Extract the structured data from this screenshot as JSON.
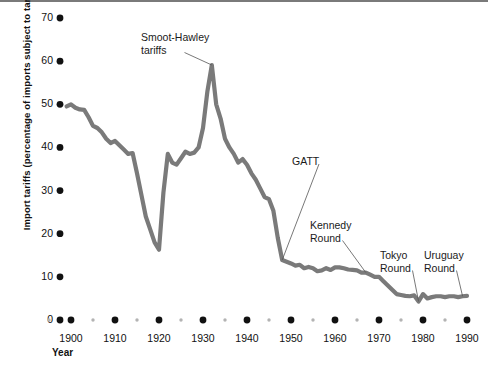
{
  "chart_data": {
    "type": "line",
    "title": "",
    "xlabel": "Year",
    "ylabel": "Import tariffs (percentage of imports subject to tariffs)",
    "xlim": [
      1895,
      1992
    ],
    "ylim": [
      0,
      72
    ],
    "grid": false,
    "legend": "none",
    "line_color": "#7a7a7a",
    "axis_dot_color": "#111111",
    "minor_dot_color": "#b3b3b3",
    "yticks": [
      0,
      10,
      20,
      30,
      40,
      50,
      60,
      70
    ],
    "ytick_labels": [
      "0",
      "10",
      "20",
      "30",
      "40",
      "50",
      "60",
      "70"
    ],
    "xticks": [
      1900,
      1910,
      1920,
      1930,
      1940,
      1950,
      1960,
      1970,
      1980,
      1990
    ],
    "xtick_labels": [
      "1900",
      "1910",
      "1920",
      "1930",
      "1940",
      "1950",
      "1960",
      "1970",
      "1980",
      "1990"
    ],
    "xminor_ticks": [
      1895,
      1905,
      1915,
      1925,
      1935,
      1945,
      1955,
      1965,
      1975,
      1985
    ],
    "series": [
      {
        "name": "Import tariffs",
        "x": [
          1899,
          1900,
          1901,
          1902,
          1903,
          1904,
          1905,
          1906,
          1907,
          1908,
          1909,
          1910,
          1911,
          1912,
          1913,
          1914,
          1915,
          1916,
          1917,
          1918,
          1919,
          1920,
          1921,
          1922,
          1923,
          1924,
          1925,
          1926,
          1927,
          1928,
          1929,
          1930,
          1931,
          1932,
          1933,
          1934,
          1935,
          1936,
          1937,
          1938,
          1939,
          1940,
          1941,
          1942,
          1943,
          1944,
          1945,
          1946,
          1947,
          1948,
          1949,
          1950,
          1951,
          1952,
          1953,
          1954,
          1955,
          1956,
          1957,
          1958,
          1959,
          1960,
          1961,
          1962,
          1963,
          1964,
          1965,
          1966,
          1967,
          1968,
          1969,
          1970,
          1971,
          1972,
          1973,
          1974,
          1975,
          1976,
          1977,
          1978,
          1979,
          1980,
          1981,
          1982,
          1983,
          1984,
          1985,
          1986,
          1987,
          1988,
          1989,
          1990
        ],
        "y": [
          49.5,
          50.0,
          49.2,
          48.8,
          48.7,
          47.0,
          45.0,
          44.5,
          43.5,
          42.0,
          41.0,
          41.5,
          40.5,
          39.5,
          38.5,
          38.7,
          34.0,
          29.0,
          24.0,
          21.0,
          18.0,
          16.3,
          29.5,
          38.5,
          36.5,
          36.0,
          37.5,
          39.0,
          38.5,
          38.8,
          40.0,
          44.5,
          53.0,
          59.1,
          50.0,
          46.7,
          42.0,
          40.0,
          38.5,
          36.5,
          37.3,
          36.0,
          34.0,
          32.5,
          30.5,
          28.5,
          28.0,
          25.3,
          19.0,
          13.9,
          13.5,
          13.1,
          12.6,
          12.8,
          12.0,
          12.3,
          12.0,
          11.3,
          11.5,
          12.0,
          11.6,
          12.2,
          12.2,
          12.0,
          11.7,
          11.6,
          11.5,
          11.0,
          11.0,
          10.5,
          10.0,
          10.0,
          9.0,
          8.0,
          7.0,
          6.0,
          5.8,
          5.6,
          5.5,
          5.7,
          4.3,
          6.0,
          5.0,
          5.3,
          5.5,
          5.5,
          5.3,
          5.5,
          5.5,
          5.3,
          5.5,
          5.6
        ]
      }
    ],
    "annotations": [
      {
        "text": "Smoot-Hawley\ntariffs",
        "label_x": 141,
        "label_y": 31,
        "point_year": 1932,
        "point_value": 59.1
      },
      {
        "text": "GATT",
        "label_x": 292,
        "label_y": 155,
        "point_year": 1948,
        "point_value": 13.9
      },
      {
        "text": "Kennedy\nRound",
        "label_x": 310,
        "label_y": 219,
        "point_year": 1967,
        "point_value": 11.0
      },
      {
        "text": "Tokyo\nRound",
        "label_x": 380,
        "label_y": 249,
        "point_year": 1979,
        "point_value": 4.3
      },
      {
        "text": "Uruguay\nRound",
        "label_x": 424,
        "label_y": 249,
        "point_year": 1989,
        "point_value": 5.5
      }
    ]
  }
}
